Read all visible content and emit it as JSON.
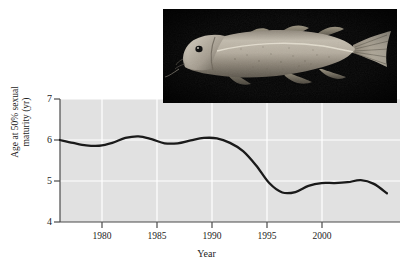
{
  "figure": {
    "background": "#ffffff",
    "plot_bg": "#e1e1e1",
    "grid_color": "#ffffff",
    "line_color": "#1a1a1a",
    "axis_color": "#555555"
  },
  "photo": {
    "name": "atlantic-cod-photograph",
    "subject": "Atlantic cod",
    "background_color": "#050505",
    "body_color": "#b9b2a6"
  },
  "chart_data": {
    "type": "line",
    "title": "",
    "xlabel": "Year",
    "ylabel": "Age at 50% sexual maturity (yr)",
    "ylabel_line1": "Age at 50% sexual",
    "ylabel_line2": "maturity (yr)",
    "xlim": [
      1978,
      2004
    ],
    "ylim": [
      4,
      7
    ],
    "xticks": [
      1980,
      1985,
      1990,
      1995,
      2000
    ],
    "xtick_labels": [
      "1980",
      "1985",
      "1990",
      "1995",
      "2000"
    ],
    "yticks": [
      4,
      5,
      6,
      7
    ],
    "ytick_labels": [
      "4",
      "5",
      "6",
      "7"
    ],
    "grid": true,
    "legend": "none",
    "series": [
      {
        "name": "Age at 50% sexual maturity",
        "x": [
          1978,
          1979,
          1980,
          1981,
          1982,
          1983,
          1984,
          1985,
          1986,
          1987,
          1988,
          1989,
          1990,
          1991,
          1992,
          1993,
          1994,
          1995,
          1996,
          1997,
          1998,
          1999,
          2000,
          2001,
          2002,
          2003
        ],
        "values": [
          6.0,
          5.93,
          5.87,
          5.86,
          5.93,
          6.05,
          6.09,
          6.02,
          5.92,
          5.92,
          5.99,
          6.05,
          6.04,
          5.93,
          5.73,
          5.38,
          4.95,
          4.72,
          4.73,
          4.88,
          4.95,
          4.95,
          4.97,
          5.02,
          4.93,
          4.7
        ]
      }
    ]
  },
  "axis_labels": {
    "x_title": "Year",
    "y_title_line1": "Age at 50% sexual",
    "y_title_line2": "maturity (yr)"
  }
}
